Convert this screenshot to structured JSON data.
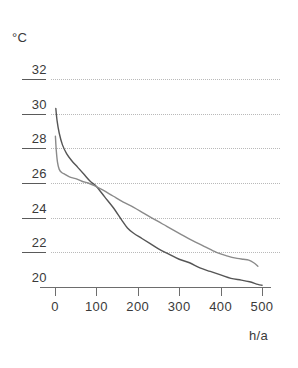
{
  "chart_data": {
    "type": "line",
    "title": "",
    "xlabel": "h/a",
    "ylabel": "°C",
    "xlim": [
      0,
      500
    ],
    "ylim": [
      20,
      32
    ],
    "grid": true,
    "legend": "none",
    "x_ticks": [
      "0",
      "100",
      "200",
      "300",
      "400",
      "500"
    ],
    "x_tick_values": [
      0,
      100,
      200,
      300,
      400,
      500
    ],
    "y_ticks": [
      "20",
      "22",
      "24",
      "26",
      "28",
      "30",
      "32"
    ],
    "y_tick_values": [
      20,
      22,
      24,
      26,
      28,
      30,
      32
    ],
    "series": [
      {
        "name": "curve-upper-start",
        "color": "#555555",
        "x": [
          2,
          5,
          10,
          18,
          28,
          40,
          55,
          70,
          85,
          100,
          120,
          140,
          160,
          175,
          190,
          210,
          230,
          250,
          275,
          300,
          325,
          350,
          375,
          400,
          425,
          450,
          470,
          490,
          500
        ],
        "y": [
          30.3,
          29.6,
          28.9,
          28.2,
          27.7,
          27.3,
          26.9,
          26.5,
          26.1,
          25.8,
          25.2,
          24.6,
          23.9,
          23.4,
          23.1,
          22.8,
          22.5,
          22.2,
          21.9,
          21.6,
          21.4,
          21.1,
          20.9,
          20.7,
          20.5,
          20.4,
          20.3,
          20.15,
          20.1
        ]
      },
      {
        "name": "curve-lower-start",
        "color": "#8a8a8a",
        "x": [
          1,
          3,
          6,
          10,
          16,
          24,
          35,
          50,
          65,
          80,
          95,
          115,
          140,
          165,
          190,
          215,
          240,
          270,
          300,
          330,
          360,
          390,
          415,
          440,
          455,
          468,
          480,
          490
        ],
        "y": [
          28.7,
          27.9,
          27.2,
          26.8,
          26.6,
          26.5,
          26.35,
          26.25,
          26.1,
          26.0,
          25.85,
          25.6,
          25.25,
          24.9,
          24.6,
          24.25,
          23.9,
          23.5,
          23.1,
          22.7,
          22.35,
          22.0,
          21.8,
          21.65,
          21.6,
          21.55,
          21.4,
          21.2
        ]
      }
    ]
  },
  "axes": {
    "y_title": "°C",
    "x_title": "h/a"
  }
}
